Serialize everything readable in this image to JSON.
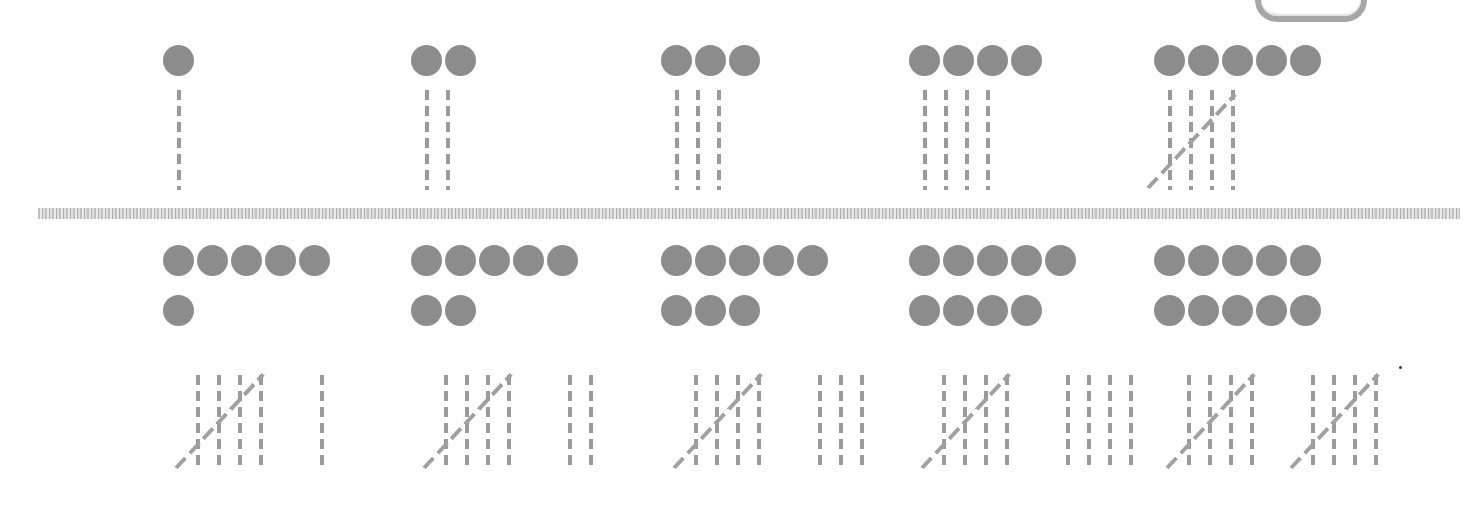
{
  "colors": {
    "dot": "#8c8c8c",
    "tally": "#9a9a9a",
    "divider": "#b5b5b5",
    "frame": "#a6a6a6",
    "background": "#ffffff"
  },
  "rows": [
    {
      "items": [
        {
          "number": 1,
          "dots": 1,
          "tally_groups": [
            1
          ]
        },
        {
          "number": 2,
          "dots": 2,
          "tally_groups": [
            2
          ]
        },
        {
          "number": 3,
          "dots": 3,
          "tally_groups": [
            3
          ]
        },
        {
          "number": 4,
          "dots": 4,
          "tally_groups": [
            4
          ]
        },
        {
          "number": 5,
          "dots": 5,
          "tally_groups": [
            5
          ]
        }
      ]
    },
    {
      "items": [
        {
          "number": 6,
          "dots": 6,
          "tally_groups": [
            5,
            1
          ]
        },
        {
          "number": 7,
          "dots": 7,
          "tally_groups": [
            5,
            2
          ]
        },
        {
          "number": 8,
          "dots": 8,
          "tally_groups": [
            5,
            3
          ]
        },
        {
          "number": 9,
          "dots": 9,
          "tally_groups": [
            5,
            4
          ]
        },
        {
          "number": 10,
          "dots": 10,
          "tally_groups": [
            5,
            5
          ]
        }
      ]
    }
  ]
}
